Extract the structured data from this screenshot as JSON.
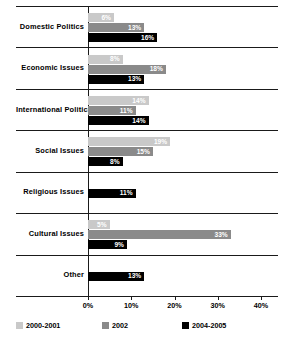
{
  "chart_data": {
    "type": "bar",
    "orientation": "horizontal",
    "title": "",
    "xlabel": "",
    "ylabel": "",
    "xlim": [
      0,
      40
    ],
    "xticks": [
      "0%",
      "10%",
      "20%",
      "30%",
      "40%"
    ],
    "xtick_values": [
      0,
      10,
      20,
      30,
      40
    ],
    "grid": false,
    "legend_position": "bottom",
    "categories": [
      "Domestic Politics",
      "Economic Issues",
      "International Politics",
      "Social Issues",
      "Religious Issues",
      "Cultural Issues",
      "Other"
    ],
    "series": [
      {
        "name": "2000-2001",
        "color": "#c9c9c9",
        "values": [
          6,
          8,
          14,
          19,
          null,
          5,
          null
        ],
        "labels": [
          "6%",
          "8%",
          "14%",
          "19%",
          "",
          "5%",
          ""
        ]
      },
      {
        "name": "2002",
        "color": "#8a8a8a",
        "values": [
          13,
          18,
          11,
          15,
          null,
          33,
          null
        ],
        "labels": [
          "13%",
          "18%",
          "11%",
          "15%",
          "",
          "33%",
          ""
        ]
      },
      {
        "name": "2004-2005",
        "color": "#000000",
        "values": [
          16,
          13,
          14,
          8,
          11,
          9,
          13
        ],
        "labels": [
          "16%",
          "13%",
          "14%",
          "8%",
          "11%",
          "9%",
          "13%"
        ]
      }
    ]
  }
}
